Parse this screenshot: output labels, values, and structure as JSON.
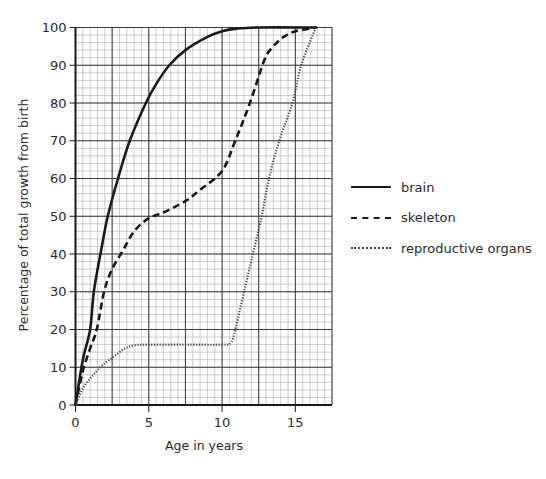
{
  "chart_data": {
    "type": "line",
    "title": "",
    "xlabel": "Age in years",
    "ylabel": "Percentage of total growth from birth",
    "xlim": [
      0,
      17.5
    ],
    "ylim": [
      0,
      100
    ],
    "x_ticks": [
      0,
      5,
      10,
      15
    ],
    "y_ticks": [
      0,
      10,
      20,
      30,
      40,
      50,
      60,
      70,
      80,
      90,
      100
    ],
    "grid": {
      "major_x": 2.5,
      "major_y": 10,
      "minor_x": 0.5,
      "minor_y": 2
    },
    "legend_position": "right",
    "series": [
      {
        "name": "brain",
        "style": "solid",
        "points": [
          [
            0,
            0
          ],
          [
            0.5,
            12
          ],
          [
            1,
            20
          ],
          [
            1.25,
            30
          ],
          [
            1.75,
            41
          ],
          [
            2.2,
            50
          ],
          [
            2.9,
            60
          ],
          [
            3.7,
            70
          ],
          [
            4.8,
            80
          ],
          [
            5.5,
            85
          ],
          [
            6.4,
            90
          ],
          [
            7.5,
            94
          ],
          [
            9,
            97.5
          ],
          [
            10,
            99
          ],
          [
            11,
            99.7
          ],
          [
            12.5,
            100
          ],
          [
            16.5,
            100
          ]
        ]
      },
      {
        "name": "skeleton",
        "style": "dashed",
        "points": [
          [
            0,
            0
          ],
          [
            0.5,
            9
          ],
          [
            1,
            15
          ],
          [
            1.45,
            20
          ],
          [
            1.95,
            30
          ],
          [
            2.5,
            36
          ],
          [
            3.25,
            41
          ],
          [
            4,
            46
          ],
          [
            5,
            49.5
          ],
          [
            6,
            51
          ],
          [
            7.5,
            54
          ],
          [
            8.5,
            57
          ],
          [
            10,
            62
          ],
          [
            10.9,
            70
          ],
          [
            11.9,
            80
          ],
          [
            12.9,
            91.5
          ],
          [
            13.5,
            95
          ],
          [
            14.2,
            97.5
          ],
          [
            15,
            99
          ],
          [
            16.4,
            100
          ]
        ]
      },
      {
        "name": "reproductive organs",
        "style": "dotted",
        "points": [
          [
            0,
            0
          ],
          [
            0.6,
            5
          ],
          [
            1.7,
            10
          ],
          [
            2.5,
            12.5
          ],
          [
            3.3,
            14.8
          ],
          [
            4,
            15.8
          ],
          [
            5,
            16
          ],
          [
            7.5,
            16
          ],
          [
            10,
            16
          ],
          [
            10.6,
            16.5
          ],
          [
            10.9,
            20
          ],
          [
            11.5,
            30
          ],
          [
            12.1,
            40
          ],
          [
            12.7,
            50
          ],
          [
            13.2,
            60
          ],
          [
            13.9,
            70
          ],
          [
            14.8,
            80
          ],
          [
            15.4,
            90
          ],
          [
            16.4,
            100
          ]
        ]
      }
    ]
  },
  "legend": {
    "items": [
      {
        "label": "brain",
        "style": "solid"
      },
      {
        "label": "skeleton",
        "style": "dashed"
      },
      {
        "label": "reproductive organs",
        "style": "dotted"
      }
    ]
  }
}
